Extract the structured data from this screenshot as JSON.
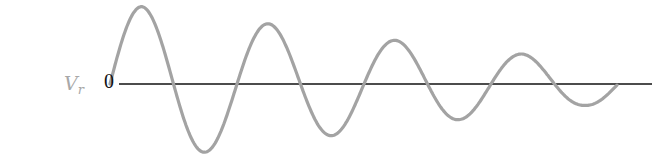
{
  "chart_data": {
    "type": "line",
    "title": "",
    "ylabel": "V",
    "ylabel_subscript": "r",
    "xlabel": "",
    "y_tick_labels": [
      "0"
    ],
    "grid": false,
    "legend": null,
    "series": [
      {
        "name": "V_r",
        "color": "#a0a0a0",
        "extrema": [
          {
            "x": 142,
            "y": 0.98
          },
          {
            "x": 207,
            "y": -0.86
          },
          {
            "x": 270,
            "y": 0.76
          },
          {
            "x": 334,
            "y": -0.65
          },
          {
            "x": 397,
            "y": 0.55
          },
          {
            "x": 460,
            "y": -0.45
          },
          {
            "x": 522,
            "y": 0.38
          },
          {
            "x": 585,
            "y": -0.27
          }
        ],
        "x_start": 110,
        "x_end": 617,
        "half_period": 63.5
      }
    ],
    "axis_color": "#111111"
  }
}
